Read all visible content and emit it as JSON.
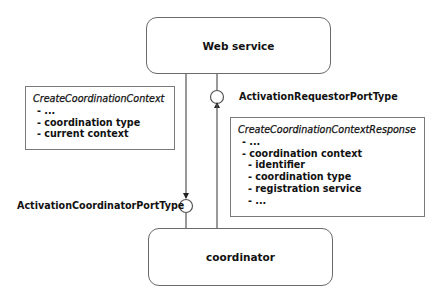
{
  "diagram": {
    "nodes": {
      "web_service": {
        "label": "Web service"
      },
      "coordinator": {
        "label": "coordinator"
      }
    },
    "ports": {
      "requestor": {
        "label": "ActivationRequestorPortType"
      },
      "coordinator": {
        "label": "ActivationCoordinatorPortType"
      }
    },
    "messages": {
      "request": {
        "title": "CreateCoordinationContext",
        "items": [
          "- ...",
          "- coordination type",
          "- current context"
        ]
      },
      "response": {
        "title": "CreateCoordinationContextResponse",
        "items": [
          "- ...",
          "- coordination context",
          "  - identifier",
          "  - coordination type",
          "  - registration service",
          "  - ..."
        ]
      }
    },
    "edges": [
      {
        "from": "web_service",
        "to": "coordinator",
        "via_port": "ActivationCoordinatorPortType",
        "message": "CreateCoordinationContext"
      },
      {
        "from": "coordinator",
        "to": "web_service",
        "via_port": "ActivationRequestorPortType",
        "message": "CreateCoordinationContextResponse"
      }
    ]
  }
}
